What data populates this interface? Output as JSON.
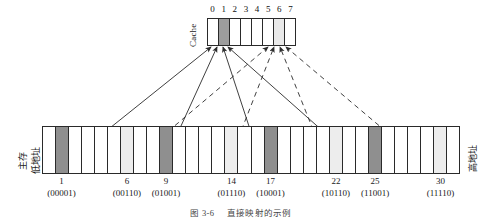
{
  "figure": {
    "caption_number": "图 3-6",
    "caption_text": "直接映射的示例"
  },
  "cache": {
    "label": "Cache",
    "indices": [
      "0",
      "1",
      "2",
      "3",
      "4",
      "5",
      "6",
      "7"
    ],
    "cells": [
      {
        "index": "0",
        "fill": "none"
      },
      {
        "index": "1",
        "fill": "dark"
      },
      {
        "index": "2",
        "fill": "none"
      },
      {
        "index": "3",
        "fill": "none"
      },
      {
        "index": "4",
        "fill": "none"
      },
      {
        "index": "5",
        "fill": "none"
      },
      {
        "index": "6",
        "fill": "light"
      },
      {
        "index": "7",
        "fill": "none"
      }
    ],
    "colors": {
      "dark": "#9d9d9d",
      "light": "#e9e9e9",
      "border": "#2a2a2a"
    }
  },
  "memory": {
    "left_label_line1": "主存",
    "left_label_line2": "低地址",
    "right_label": "高地址",
    "block_count": 32,
    "highlighted_dark_blocks": [
      1,
      9,
      17,
      25
    ],
    "highlighted_light_blocks": [
      6,
      14,
      22,
      30
    ],
    "colors": {
      "dark": "#8f8f8f",
      "light": "#ededed",
      "border": "#2a2a2a"
    },
    "address_labels": [
      {
        "number": "1",
        "binary": "(00001)",
        "block": 1
      },
      {
        "number": "6",
        "binary": "(00110)",
        "block": 6
      },
      {
        "number": "9",
        "binary": "(01001)",
        "block": 9
      },
      {
        "number": "14",
        "binary": "(01110)",
        "block": 14
      },
      {
        "number": "17",
        "binary": "(10001)",
        "block": 17
      },
      {
        "number": "22",
        "binary": "(10110)",
        "block": 22
      },
      {
        "number": "25",
        "binary": "(11001)",
        "block": 25
      },
      {
        "number": "30",
        "binary": "(11110)",
        "block": 30
      }
    ]
  },
  "mappings": {
    "solid_to_cache_block": "1",
    "dashed_to_cache_block": "6",
    "solid_sources": [
      "1",
      "9",
      "17",
      "25"
    ],
    "dashed_sources": [
      "6",
      "14",
      "22",
      "30"
    ]
  }
}
